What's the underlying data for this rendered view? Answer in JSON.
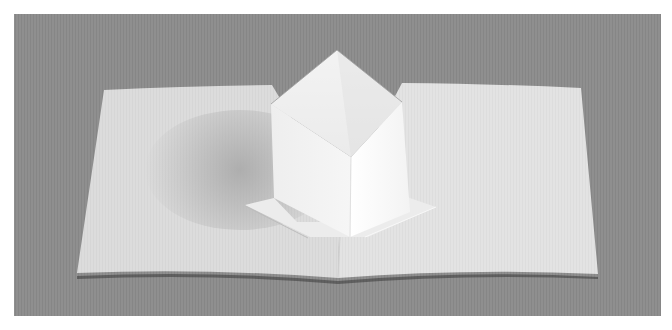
{
  "image": {
    "subject": "pop-up paper card with open cube",
    "colors": {
      "background": "#8f8f8f",
      "card_light": "#e6e6e6",
      "card_mid": "#d6d6d6",
      "shadow": "#b4b4b4",
      "cube_left_face": "#f2f2f2",
      "cube_right_face": "#fbfbfb",
      "cube_inner": "#e9e9e9",
      "edge_dark": "#5a5a5a"
    }
  }
}
